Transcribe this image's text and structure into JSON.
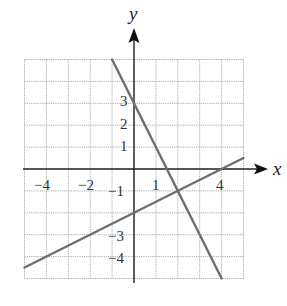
{
  "chart_data": {
    "type": "line",
    "title": "",
    "xlabel": "x",
    "ylabel": "y",
    "xlim": [
      -5,
      5
    ],
    "ylim": [
      -5,
      5
    ],
    "grid": true,
    "grid_step": 1,
    "x_tick_labels": [
      "-4",
      "-2",
      "1",
      "4"
    ],
    "x_tick_values": [
      -4,
      -2,
      1,
      4
    ],
    "y_tick_labels": [
      "3",
      "2",
      "1",
      "-1",
      "-3",
      "-4"
    ],
    "y_tick_values": [
      3,
      2,
      1,
      -1,
      -3,
      -4
    ],
    "series": [
      {
        "name": "y = -2x + 3",
        "slope": -2,
        "intercept": 3,
        "points": [
          [
            -1,
            5
          ],
          [
            0,
            3
          ],
          [
            2,
            -1
          ],
          [
            4,
            -5
          ]
        ]
      },
      {
        "name": "y = 0.5x - 2",
        "slope": 0.5,
        "intercept": -2,
        "points": [
          [
            -5,
            -4.5
          ],
          [
            0,
            -2
          ],
          [
            2,
            -1
          ],
          [
            4,
            0
          ],
          [
            5,
            0.5
          ]
        ]
      }
    ],
    "intersection": [
      2,
      -1
    ],
    "colors": {
      "line": "#6e6e6e",
      "axis": "#222222",
      "grid": "#aaaaaa"
    }
  },
  "labels": {
    "x_axis": "x",
    "y_axis": "y",
    "x_ticks": [
      "−4",
      "−2",
      "1",
      "4"
    ],
    "y_ticks": [
      "3",
      "2",
      "1",
      "−1",
      "−3",
      "−4"
    ]
  }
}
